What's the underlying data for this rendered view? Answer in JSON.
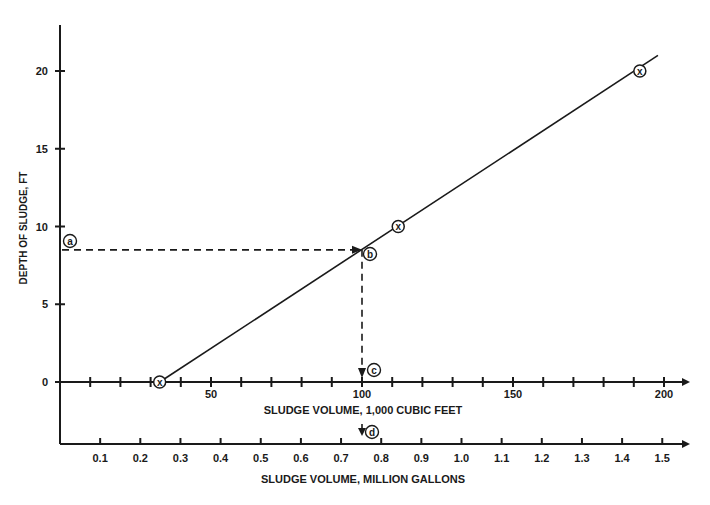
{
  "chart_data": {
    "type": "line",
    "title": "",
    "xlabel": "SLUDGE VOLUME, 1,000 CUBIC FEET",
    "xlabel2": "SLUDGE VOLUME, MILLION GALLONS",
    "ylabel": "DEPTH OF SLUDGE, FT",
    "xlim": [
      0,
      205
    ],
    "x2lim": [
      0,
      1.53
    ],
    "ylim": [
      -3,
      23
    ],
    "grid": false,
    "legend": null,
    "x_ticks": [
      50,
      100,
      150,
      200
    ],
    "x_tick_labels": [
      "50",
      "100",
      "150",
      "200"
    ],
    "x2_ticks": [
      0.1,
      0.2,
      0.3,
      0.4,
      0.5,
      0.6,
      0.7,
      0.8,
      0.9,
      1.0,
      1.1,
      1.2,
      1.3,
      1.4,
      1.5
    ],
    "x2_tick_labels": [
      "0.1",
      "0.2",
      "0.3",
      "0.4",
      "0.5",
      "0.6",
      "0.7",
      "0.8",
      "0.9",
      "1.0",
      "1.1",
      "1.2",
      "1.3",
      "1.4",
      "1.5"
    ],
    "y_ticks": [
      0,
      5,
      10,
      15,
      20
    ],
    "y_tick_labels": [
      "0",
      "5",
      "10",
      "15",
      "20"
    ],
    "series": [
      {
        "name": "Depth vs. volume",
        "x": [
          33,
          112,
          192
        ],
        "y": [
          0,
          10,
          20
        ],
        "marker": "circled-x",
        "line_extends_to": [
          198,
          21
        ]
      }
    ],
    "annotations": [
      {
        "label": "a",
        "x": 3,
        "y": 8.5,
        "note": "Given sludge depth, 8.5 ft"
      },
      {
        "label": "b",
        "x": 100,
        "y": 8.5,
        "note": "Intersection with curve"
      },
      {
        "label": "c",
        "x": 100,
        "y": 0,
        "note": "Read volume, 100 (1,000 cu ft)"
      },
      {
        "label": "d",
        "x2": 0.75,
        "note": "Equivalent volume, 0.75 million gallons"
      }
    ]
  }
}
